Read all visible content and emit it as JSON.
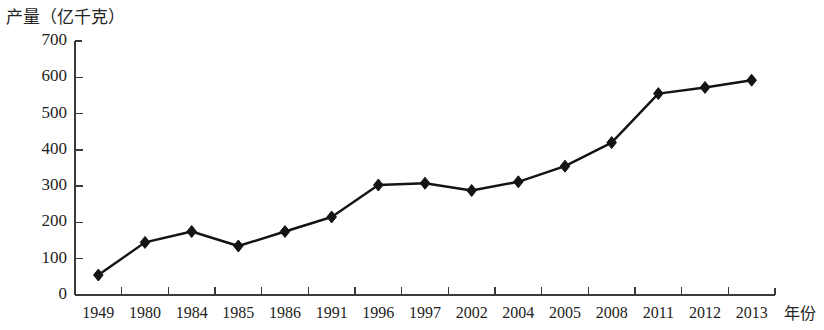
{
  "chart_data": {
    "type": "line",
    "title": "",
    "ylabel": "产量（亿千克）",
    "xlabel": "年份",
    "categories": [
      "1949",
      "1980",
      "1984",
      "1985",
      "1986",
      "1991",
      "1996",
      "1997",
      "2002",
      "2004",
      "2005",
      "2008",
      "2011",
      "2012",
      "2013"
    ],
    "values": [
      55,
      145,
      175,
      135,
      175,
      215,
      303,
      308,
      288,
      312,
      355,
      420,
      555,
      572,
      592
    ],
    "series": [
      {
        "name": "产量",
        "values": [
          55,
          145,
          175,
          135,
          175,
          215,
          303,
          308,
          288,
          312,
          355,
          420,
          555,
          572,
          592
        ]
      }
    ],
    "ylim": [
      0,
      700
    ],
    "yticks": [
      0,
      100,
      200,
      300,
      400,
      500,
      600,
      700
    ],
    "ytick_labels": [
      "0",
      "100",
      "200",
      "300",
      "400",
      "500",
      "600",
      "700"
    ],
    "grid": false,
    "legend": "none",
    "marker": "diamond",
    "line_color": "#141414",
    "marker_color": "#141414",
    "axis_color": "#3a3a3a"
  }
}
